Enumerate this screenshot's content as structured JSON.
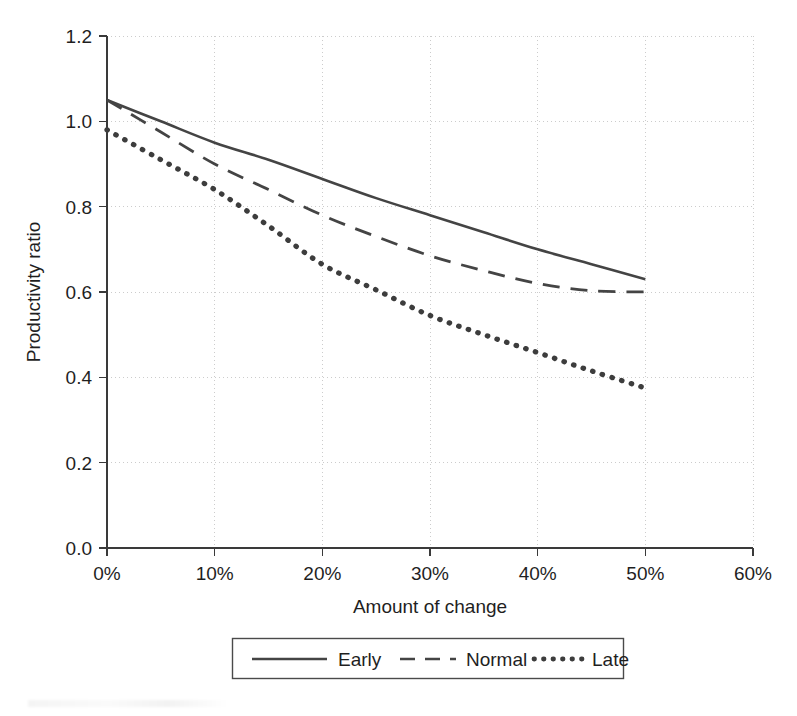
{
  "chart_data": {
    "type": "line",
    "title": "",
    "xlabel": "Amount of change",
    "ylabel": "Productivity ratio",
    "xlim": [
      0,
      60
    ],
    "ylim": [
      0.0,
      1.2
    ],
    "grid": true,
    "legend_position": "below",
    "x_tick_labels": [
      "0%",
      "10%",
      "20%",
      "30%",
      "40%",
      "50%",
      "60%"
    ],
    "x_ticks": [
      0,
      10,
      20,
      30,
      40,
      50,
      60
    ],
    "y_tick_labels": [
      "0.0",
      "0.2",
      "0.4",
      "0.6",
      "0.8",
      "1.0",
      "1.2"
    ],
    "y_ticks": [
      0.0,
      0.2,
      0.4,
      0.6,
      0.8,
      1.0,
      1.2
    ],
    "x": [
      0,
      5,
      10,
      15,
      20,
      25,
      30,
      35,
      40,
      45,
      50
    ],
    "series": [
      {
        "name": "Early",
        "style": "solid",
        "color": "#444444",
        "values": [
          1.05,
          1.0,
          0.95,
          0.91,
          0.865,
          0.82,
          0.78,
          0.74,
          0.7,
          0.665,
          0.63
        ]
      },
      {
        "name": "Normal",
        "style": "dashed",
        "color": "#444444",
        "values": [
          1.05,
          0.975,
          0.9,
          0.84,
          0.78,
          0.73,
          0.685,
          0.65,
          0.62,
          0.603,
          0.6
        ]
      },
      {
        "name": "Late",
        "style": "dotted",
        "color": "#3d3d3d",
        "values": [
          0.98,
          0.91,
          0.84,
          0.755,
          0.665,
          0.605,
          0.545,
          0.5,
          0.458,
          0.415,
          0.375
        ]
      }
    ]
  },
  "legend": {
    "entries": [
      {
        "label": "Early"
      },
      {
        "label": "Normal"
      },
      {
        "label": "Late"
      }
    ]
  },
  "axes": {
    "x_title": "Amount of change",
    "y_title": "Productivity ratio"
  }
}
